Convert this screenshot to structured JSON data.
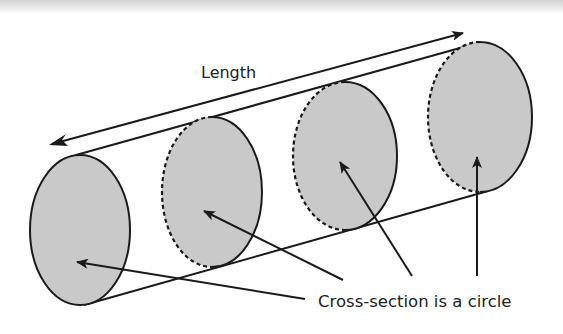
{
  "diagram": {
    "length_label": "Length",
    "cross_section_label": "Cross-section is a circle",
    "colors": {
      "fill": "#c9c9c9",
      "stroke": "#1a1a1a",
      "background": "#ffffff"
    },
    "cross_sections": [
      {
        "id": 1,
        "cx": 80,
        "cy": 230,
        "rx": 50,
        "ry": 75,
        "back_edge": "solid"
      },
      {
        "id": 2,
        "cx": 212,
        "cy": 192,
        "rx": 50,
        "ry": 75,
        "back_edge": "dashed"
      },
      {
        "id": 3,
        "cx": 345,
        "cy": 156,
        "rx": 52,
        "ry": 74,
        "back_edge": "dashed"
      },
      {
        "id": 4,
        "cx": 480,
        "cy": 117,
        "rx": 52,
        "ry": 75,
        "back_edge": "dashed"
      }
    ],
    "pointer_arrows": 4,
    "length_arrow": "double-headed"
  }
}
